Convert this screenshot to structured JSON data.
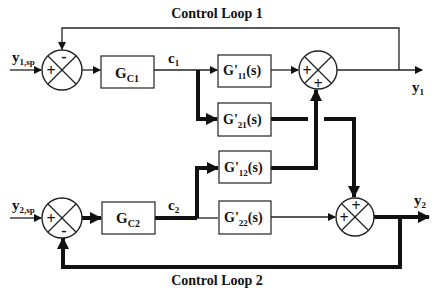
{
  "diagram": {
    "title_loop1": "Control Loop 1",
    "title_loop2": "Control Loop 2",
    "inputs": {
      "y1sp_main": "y",
      "y1sp_sub": "1,sp",
      "y2sp_main": "y",
      "y2sp_sub": "2,sp"
    },
    "outputs": {
      "y1_main": "y",
      "y1_sub": "1",
      "y2_main": "y",
      "y2_sub": "2"
    },
    "signals": {
      "c1_main": "c",
      "c1_sub": "1",
      "c2_main": "c",
      "c2_sub": "2"
    },
    "controllers": [
      {
        "main": "G",
        "sub": "C1"
      },
      {
        "main": "G",
        "sub": "C2"
      }
    ],
    "process_blocks": [
      {
        "main": "G'",
        "sub": "11",
        "suffix": "(s)"
      },
      {
        "main": "G'",
        "sub": "21",
        "suffix": "(s)"
      },
      {
        "main": "G'",
        "sub": "12",
        "suffix": "(s)"
      },
      {
        "main": "G'",
        "sub": "22",
        "suffix": "(s)"
      }
    ],
    "summers": [
      {
        "id": "sp1",
        "signs": [
          "+",
          "-"
        ]
      },
      {
        "id": "out1",
        "signs": [
          "+",
          "+"
        ]
      },
      {
        "id": "sp2",
        "signs": [
          "+",
          "-"
        ]
      },
      {
        "id": "out2",
        "signs": [
          "+",
          "+"
        ]
      }
    ]
  }
}
